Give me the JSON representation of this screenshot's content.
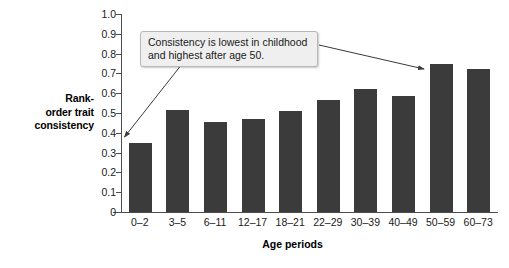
{
  "chart_data": {
    "type": "bar",
    "title": "",
    "categories": [
      "0–2",
      "3–5",
      "6–11",
      "12–17",
      "18–21",
      "22–29",
      "30–39",
      "40–49",
      "50–59",
      "60–73"
    ],
    "values": [
      0.35,
      0.515,
      0.455,
      0.47,
      0.51,
      0.565,
      0.62,
      0.585,
      0.75,
      0.72
    ],
    "xlabel": "Age periods",
    "ylabel": "Rank-order trait consistency",
    "ylim": [
      0,
      1.0
    ],
    "ytick_labels": [
      "1.0",
      "0.9",
      "0.8",
      "0.7",
      "0.6",
      "0.5",
      "0.4",
      "0.3",
      "0.2",
      "0.1",
      "0"
    ],
    "ytick_values": [
      1.0,
      0.9,
      0.8,
      0.7,
      0.6,
      0.5,
      0.4,
      0.3,
      0.2,
      0.1,
      0
    ],
    "grid": false,
    "legend": "none",
    "bar_color": "#3b3b3b",
    "axis_color": "#4d4d4d",
    "annotations": [
      {
        "text": "Consistency is lowest in childhood and highest after age 50.",
        "lines": [
          "Consistency is lowest in childhood",
          "and highest after age 50."
        ],
        "points_to": [
          "0–2",
          "50–59"
        ]
      }
    ]
  },
  "axis": {
    "y_title_lines": [
      "Rank-",
      "order trait",
      "consistency"
    ],
    "x_title": "Age periods"
  }
}
